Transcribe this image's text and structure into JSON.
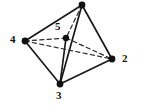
{
  "figure": {
    "name": "tetrahedron-with-interior-vertex",
    "type": "diagram",
    "width": 149,
    "height": 107,
    "background_color": "#ffffff",
    "line_color": "#1a1a1a",
    "dash_color": "#2b2b2b",
    "vertex_color": "#111111"
  },
  "vertices": [
    {
      "id": "v1",
      "label": "",
      "x": 82,
      "y": 5,
      "labeled": false,
      "dot_radius": 3.4
    },
    {
      "id": "v2",
      "label": "2",
      "x": 112,
      "y": 59,
      "labeled": true,
      "dot_radius": 3.4,
      "label_x": 122,
      "label_y": 53
    },
    {
      "id": "v3",
      "label": "3",
      "x": 60,
      "y": 84,
      "labeled": true,
      "dot_radius": 3.4,
      "label_x": 56,
      "label_y": 90
    },
    {
      "id": "v4",
      "label": "4",
      "x": 25,
      "y": 41,
      "labeled": true,
      "dot_radius": 3.4,
      "label_x": 10,
      "label_y": 34
    },
    {
      "id": "v5",
      "label": "5",
      "x": 66,
      "y": 38,
      "labeled": true,
      "dot_radius": 3.2,
      "label_x": 55,
      "label_y": 21
    }
  ],
  "edges_solid": [
    {
      "from": "v1",
      "to": "v4",
      "x1": 82,
      "y1": 5,
      "x2": 25,
      "y2": 41
    },
    {
      "from": "v1",
      "to": "v2",
      "x1": 82,
      "y1": 5,
      "x2": 112,
      "y2": 59
    },
    {
      "from": "v1",
      "to": "v3",
      "x1": 82,
      "y1": 5,
      "x2": 60,
      "y2": 84
    },
    {
      "from": "v4",
      "to": "v3",
      "x1": 25,
      "y1": 41,
      "x2": 60,
      "y2": 84
    },
    {
      "from": "v3",
      "to": "v2",
      "x1": 60,
      "y1": 84,
      "x2": 112,
      "y2": 59
    },
    {
      "from": "v5",
      "to": "v3",
      "x1": 66,
      "y1": 38,
      "x2": 60,
      "y2": 84
    }
  ],
  "edges_dashed": [
    {
      "from": "v4",
      "to": "v5",
      "x1": 25,
      "y1": 41,
      "x2": 66,
      "y2": 38
    },
    {
      "from": "v5",
      "to": "v2",
      "x1": 66,
      "y1": 38,
      "x2": 112,
      "y2": 59
    },
    {
      "from": "v4",
      "to": "v2",
      "x1": 25,
      "y1": 41,
      "x2": 112,
      "y2": 59
    },
    {
      "from": "v1",
      "to": "v5",
      "x1": 82,
      "y1": 5,
      "x2": 66,
      "y2": 38
    }
  ],
  "chart_data": {
    "type": "diagram",
    "title": "",
    "node_labels": [
      "",
      "2",
      "3",
      "4",
      "5"
    ],
    "node_positions": [
      [
        82,
        5
      ],
      [
        112,
        59
      ],
      [
        60,
        84
      ],
      [
        25,
        41
      ],
      [
        66,
        38
      ]
    ],
    "solid_edge_pairs": [
      [
        "v1",
        "v4"
      ],
      [
        "v1",
        "v2"
      ],
      [
        "v1",
        "v3"
      ],
      [
        "v4",
        "v3"
      ],
      [
        "v3",
        "v2"
      ],
      [
        "v5",
        "v3"
      ]
    ],
    "dashed_edge_pairs": [
      [
        "v4",
        "v5"
      ],
      [
        "v5",
        "v2"
      ],
      [
        "v4",
        "v2"
      ],
      [
        "v1",
        "v5"
      ]
    ]
  }
}
